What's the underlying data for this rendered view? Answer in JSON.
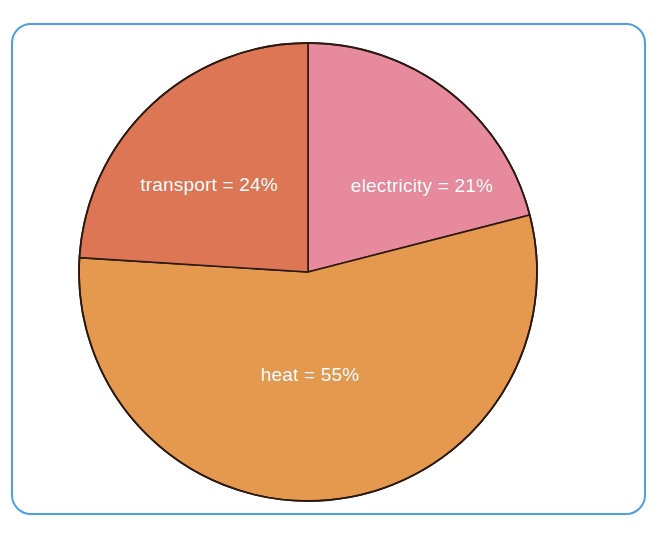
{
  "figure": {
    "background_color": "#ffffff",
    "frame": {
      "name": "chart-border-frame",
      "border_color": "#4e9fe0",
      "corner_radius_px": 20
    }
  },
  "chart_data": {
    "type": "pie",
    "title": "",
    "subtitle": "",
    "xlabel": "",
    "ylabel": "",
    "legend_position": "none",
    "grid": false,
    "labels_inside_slices": true,
    "start_angle_deg": 0,
    "direction": "clockwise",
    "categories": [
      "electricity",
      "heat",
      "transport"
    ],
    "values": [
      21,
      55,
      24
    ],
    "unit": "%",
    "total": 100,
    "slices": [
      {
        "name": "electricity",
        "label": "electricity = 21%",
        "value": 21,
        "unit": "%",
        "color": "#e88a9e",
        "start_angle_deg": 0,
        "end_angle_deg": 75.6
      },
      {
        "name": "heat",
        "label": "heat = 55%",
        "value": 55,
        "unit": "%",
        "color": "#e4994f",
        "start_angle_deg": 75.6,
        "end_angle_deg": 273.6
      },
      {
        "name": "transport",
        "label": "transport = 24%",
        "value": 24,
        "unit": "%",
        "color": "#dd7655",
        "start_angle_deg": 273.6,
        "end_angle_deg": 360
      }
    ],
    "slice_outline_color": "#2b1a12",
    "label_text_color": "#ffffff",
    "geometry": {
      "center_x": 308,
      "center_y": 272,
      "radius": 229
    }
  }
}
